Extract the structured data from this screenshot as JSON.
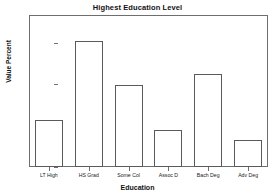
{
  "chart_data": {
    "type": "bar",
    "title": "Highest Education Level",
    "xlabel": "Education",
    "ylabel": "Value Percent",
    "categories": [
      "LT High",
      "HS Grad",
      "Some Col",
      "Assoc D",
      "Bach Deg",
      "Adv Deg"
    ],
    "values": [
      11.5,
      30.5,
      19.8,
      9.0,
      22.5,
      6.5
    ],
    "ylim": [
      0.0,
      36.8
    ],
    "ytick_labels": [
      "0.0",
      "10.0",
      "20.0",
      "30.0"
    ],
    "ytick_values": [
      0.0,
      10.0,
      20.0,
      30.0
    ],
    "grid": false,
    "legend": null,
    "bar_fill_color": "#ffffff",
    "bar_edge_color": "#5a5a5a",
    "axis_color": "#6e6e6e",
    "background_color": "#ffffff"
  }
}
